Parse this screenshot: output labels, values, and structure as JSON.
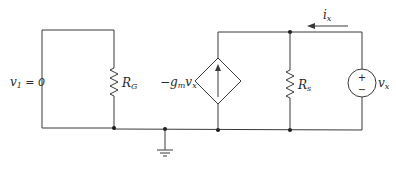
{
  "diagram": {
    "type": "small-signal equivalent circuit",
    "labels": {
      "v1_var": "v",
      "v1_sub": "1",
      "v1_eq": " = 0",
      "rg_main": "R",
      "rg_sub": "G",
      "gm_minus": "−",
      "gm_g": "g",
      "gm_sub": "m",
      "gm_v": "v",
      "gm_vsub": "x",
      "rs_main": "R",
      "rs_sub": "s",
      "ix_main": "i",
      "ix_sub": "x",
      "vx_main": "v",
      "vx_sub": "x",
      "plus": "+",
      "minus": "−"
    },
    "components": [
      {
        "id": "RG",
        "kind": "resistor",
        "label": "R_G"
      },
      {
        "id": "gm",
        "kind": "dependent current source",
        "label": "-g_m v_x",
        "direction": "up"
      },
      {
        "id": "Rs",
        "kind": "resistor",
        "label": "R_s"
      },
      {
        "id": "vx",
        "kind": "voltage source",
        "label": "v_x",
        "polarity": "+ top"
      },
      {
        "id": "gnd",
        "kind": "ground"
      }
    ],
    "annotations": [
      {
        "id": "v1",
        "text": "v1 = 0"
      },
      {
        "id": "ix",
        "text": "i_x",
        "arrow": "left"
      }
    ],
    "colors": {
      "line": "#3a3a3a",
      "text": "#2a2a2a",
      "background": "#ffffff"
    }
  }
}
